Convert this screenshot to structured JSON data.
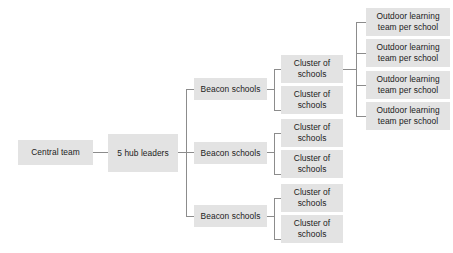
{
  "diagram": {
    "type": "organizational-hierarchy",
    "palette": {
      "box_fill": "#e3e3e3",
      "text": "#1c1c1c",
      "connector": "#8c8c8c",
      "background": "#ffffff"
    },
    "levels": [
      {
        "name": "central",
        "nodes": [
          {
            "id": "central-team",
            "label": "Central team"
          }
        ]
      },
      {
        "name": "hub",
        "nodes": [
          {
            "id": "hub-leaders",
            "label": "5 hub leaders"
          }
        ]
      },
      {
        "name": "beacon",
        "nodes": [
          {
            "id": "beacon-1",
            "label": "Beacon schools"
          },
          {
            "id": "beacon-2",
            "label": "Beacon schools"
          },
          {
            "id": "beacon-3",
            "label": "Beacon schools"
          }
        ]
      },
      {
        "name": "cluster",
        "nodes": [
          {
            "id": "cluster-1",
            "label": "Cluster of\nschools"
          },
          {
            "id": "cluster-2",
            "label": "Cluster of\nschools"
          },
          {
            "id": "cluster-3",
            "label": "Cluster of\nschools"
          },
          {
            "id": "cluster-4",
            "label": "Cluster of\nschools"
          },
          {
            "id": "cluster-5",
            "label": "Cluster of\nschools"
          },
          {
            "id": "cluster-6",
            "label": "Cluster of\nschools"
          }
        ]
      },
      {
        "name": "outdoor",
        "nodes": [
          {
            "id": "outdoor-1",
            "label": "Outdoor learning\nteam per school"
          },
          {
            "id": "outdoor-2",
            "label": "Outdoor learning\nteam per school"
          },
          {
            "id": "outdoor-3",
            "label": "Outdoor learning\nteam per school"
          },
          {
            "id": "outdoor-4",
            "label": "Outdoor learning\nteam per school"
          }
        ]
      }
    ]
  }
}
